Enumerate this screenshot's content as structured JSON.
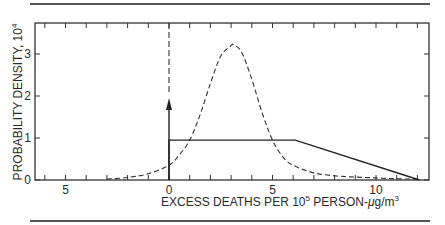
{
  "chart_data": {
    "type": "line",
    "title": "",
    "xlabel": "EXCESS DEATHS PER 10^5 PERSON-μg/m^3",
    "xlabel_parts": {
      "main": "EXCESS DEATHS PER 10",
      "sup1": "5",
      "mid": " PERSON-",
      "mu": "μ",
      "unit": "g/m",
      "sup2": "3"
    },
    "ylabel": "PROBABILITY DENSITY, 10^4",
    "ylabel_parts": {
      "main": "PROBABILITY DENSITY, 10",
      "sup": "4"
    },
    "xlim": [
      -6.5,
      12.7
    ],
    "ylim": [
      0,
      3.8
    ],
    "x_ticks": [
      -6,
      -5,
      -4,
      -3,
      -2,
      -1,
      0,
      1,
      2,
      3,
      4,
      5,
      6,
      7,
      8,
      9,
      10,
      11,
      12
    ],
    "x_tick_labels": [
      {
        "value": -5,
        "label": "5"
      },
      {
        "value": 0,
        "label": "0"
      },
      {
        "value": 5,
        "label": "5"
      },
      {
        "value": 10,
        "label": "10"
      }
    ],
    "y_ticks": [
      0,
      1,
      2,
      3
    ],
    "y_tick_labels": [
      "0",
      "1",
      "2",
      "3"
    ],
    "grid": false,
    "legend": null,
    "series": [
      {
        "name": "dashed-distribution",
        "style": "dashed",
        "x": [
          -3,
          -2,
          -1,
          0,
          0.5,
          1,
          1.5,
          2,
          2.5,
          3,
          3.1,
          3.5,
          4,
          4.5,
          5,
          5.5,
          6,
          7,
          8,
          9,
          10,
          11,
          12
        ],
        "values": [
          0.02,
          0.06,
          0.15,
          0.35,
          0.6,
          0.95,
          1.55,
          2.3,
          2.95,
          3.2,
          3.22,
          3.05,
          2.4,
          1.6,
          0.95,
          0.55,
          0.35,
          0.17,
          0.1,
          0.07,
          0.05,
          0.03,
          0.02
        ]
      },
      {
        "name": "solid-distribution",
        "style": "solid",
        "x": [
          0,
          0,
          6.1,
          12.1
        ],
        "values": [
          0,
          0.95,
          0.95,
          0
        ]
      },
      {
        "name": "delta-spike-at-zero",
        "style": "arrow",
        "x": [
          0,
          0
        ],
        "values": [
          0,
          2.0
        ]
      },
      {
        "name": "delta-dashed-at-zero",
        "style": "dashed-vertical",
        "x": [
          0,
          0
        ],
        "values": [
          2.0,
          3.8
        ]
      }
    ]
  }
}
